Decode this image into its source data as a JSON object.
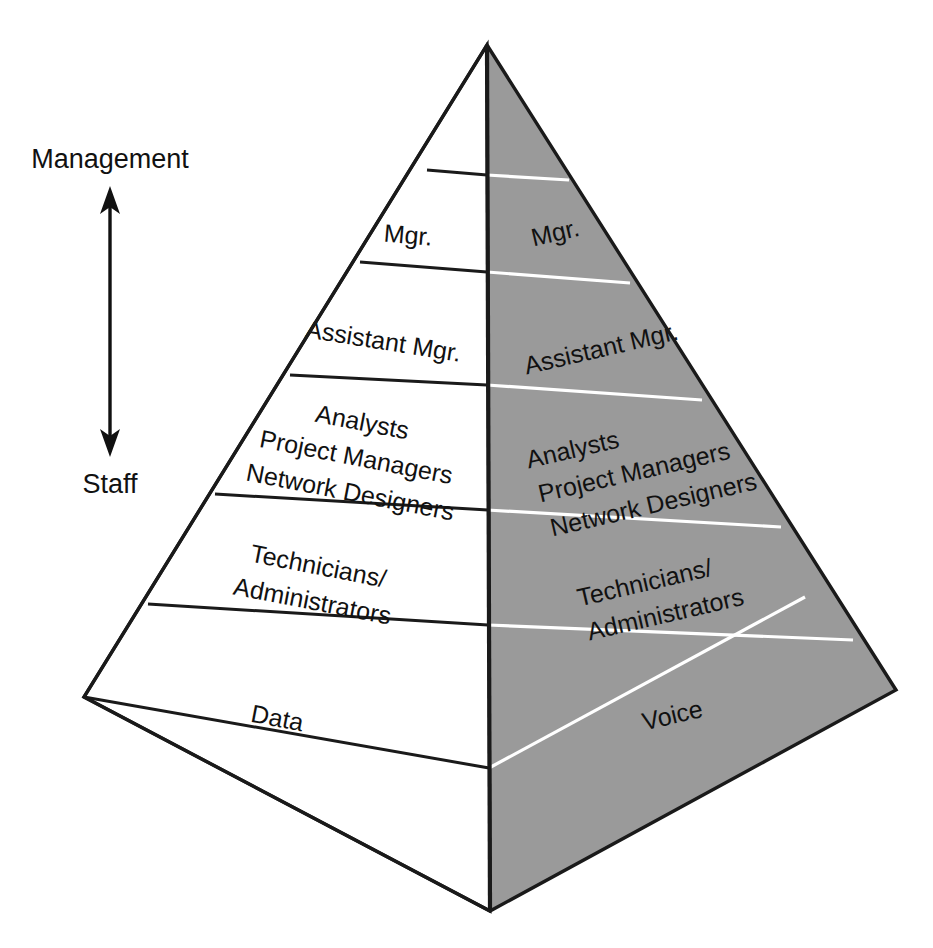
{
  "diagram": {
    "type": "3d-pyramid-hierarchy",
    "background_color": "#ffffff",
    "front_face_color": "#ffffff",
    "right_face_color": "#9a9a9a",
    "line_color": "#1a1a1a",
    "right_face_divider_color": "#ffffff",
    "apex": {
      "x": 487,
      "y": 45
    },
    "base_left": {
      "x": 84,
      "y": 697
    },
    "base_center": {
      "x": 490,
      "y": 911
    },
    "base_right": {
      "x": 896,
      "y": 690
    }
  },
  "axis": {
    "top_label": "Management",
    "bottom_label": "Staff",
    "arrow_direction": "double",
    "orientation": "vertical"
  },
  "front_face": {
    "name": "Data",
    "base_label": "Data",
    "tiers": [
      {
        "index": 0,
        "label": ""
      },
      {
        "index": 1,
        "label": "Mgr."
      },
      {
        "index": 2,
        "label": "Assistant Mgr."
      },
      {
        "index": 3,
        "label": "Analysts\nProject Managers\nNetwork Designers"
      },
      {
        "index": 4,
        "label": "Technicians/\nAdministrators"
      },
      {
        "index": 5,
        "label": "Data"
      }
    ],
    "tier_labels": {
      "t0": "",
      "t1": "Mgr.",
      "t2": "Assistant Mgr.",
      "t3_line1": "Analysts",
      "t3_line2": "Project Managers",
      "t3_line3": "Network Designers",
      "t4_line1": "Technicians/",
      "t4_line2": "Administrators",
      "t5": "Data"
    }
  },
  "right_face": {
    "name": "Voice",
    "base_label": "Voice",
    "tiers": [
      {
        "index": 0,
        "label": ""
      },
      {
        "index": 1,
        "label": "Mgr."
      },
      {
        "index": 2,
        "label": "Assistant Mgr."
      },
      {
        "index": 3,
        "label": "Analysts\nProject Managers\nNetwork Designers"
      },
      {
        "index": 4,
        "label": "Technicians/\nAdministrators"
      },
      {
        "index": 5,
        "label": "Voice"
      }
    ],
    "tier_labels": {
      "t0": "",
      "t1": "Mgr.",
      "t2": "Assistant Mgr.",
      "t3_line1": "Analysts",
      "t3_line2": "Project Managers",
      "t3_line3": "Network Designers",
      "t4_line1": "Technicians/",
      "t4_line2": "Administrators",
      "t5": "Voice"
    }
  }
}
